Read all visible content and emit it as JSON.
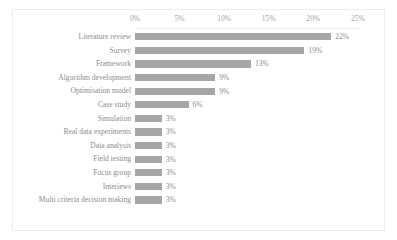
{
  "chart_data": {
    "type": "bar",
    "orientation": "horizontal",
    "title": "",
    "xlabel": "",
    "ylabel": "",
    "xlim": [
      0,
      25
    ],
    "grid": false,
    "legend": null,
    "axis_position": "top",
    "bar_color": "#a6a6a6",
    "text_color": "#8c8c8c",
    "tick_labels": [
      "0%",
      "5%",
      "10%",
      "15%",
      "20%",
      "25%"
    ],
    "tick_values": [
      0,
      5,
      10,
      15,
      20,
      25
    ],
    "categories": [
      "Literature review",
      "Survey",
      "Framework",
      "Algorithm development",
      "Optimisation model",
      "Case study",
      "Simulation",
      "Real data experiments",
      "Data analysis",
      "Field testing",
      "Focus group",
      "Interiews",
      "Multi criteria decision making"
    ],
    "values": [
      22,
      19,
      13,
      9,
      9,
      6,
      3,
      3,
      3,
      3,
      3,
      3,
      3
    ],
    "data_labels": [
      "22%",
      "19%",
      "13%",
      "9%",
      "9%",
      "6%",
      "3%",
      "3%",
      "3%",
      "3%",
      "3%",
      "3%",
      "3%"
    ]
  }
}
